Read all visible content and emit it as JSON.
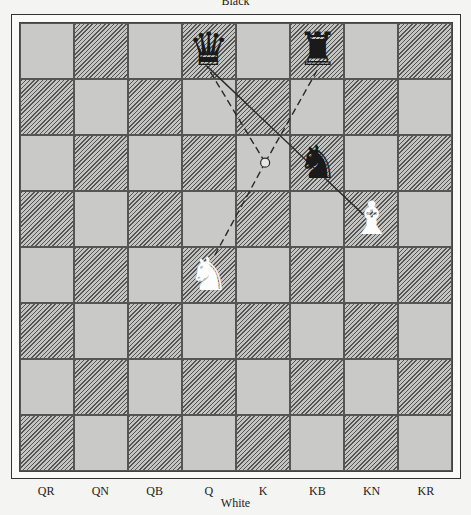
{
  "labels": {
    "top": "Black",
    "bottom": "White"
  },
  "files": [
    "QR",
    "QN",
    "QB",
    "Q",
    "K",
    "KB",
    "KN",
    "KR"
  ],
  "board": {
    "rows": 8,
    "cols": 8,
    "top_left_square": "light",
    "light_color": "#c9c9c7",
    "dark_style": "hatched"
  },
  "pieces": [
    {
      "id": "black-queen",
      "side": "black",
      "type": "queen",
      "glyph": "♛",
      "file": "Q",
      "col": 3,
      "row": 0
    },
    {
      "id": "black-rook",
      "side": "black",
      "type": "rook",
      "glyph": "♜",
      "file": "KB",
      "col": 5,
      "row": 0
    },
    {
      "id": "black-knight",
      "side": "black",
      "type": "knight",
      "glyph": "♞",
      "file": "KB",
      "col": 5,
      "row": 2
    },
    {
      "id": "white-bishop",
      "side": "white",
      "type": "bishop",
      "glyph": "♝",
      "file": "KN",
      "col": 6,
      "row": 3
    },
    {
      "id": "white-knight",
      "side": "white",
      "type": "knight",
      "glyph": "♞",
      "file": "Q",
      "col": 3,
      "row": 4
    }
  ],
  "annotations": {
    "target_circle": {
      "file": "K",
      "col": 4,
      "row": 2
    },
    "lines": [
      {
        "name": "bishop-to-queen",
        "style": "solid",
        "from": "white-bishop",
        "to": "black-queen"
      },
      {
        "name": "target-to-queen",
        "style": "dashed",
        "from": "target_circle",
        "to": "black-queen"
      },
      {
        "name": "target-to-rook",
        "style": "dashed",
        "from": "target_circle",
        "to": "black-rook"
      },
      {
        "name": "knight-to-target",
        "style": "dashed",
        "from": "white-knight",
        "to": "target_circle"
      }
    ]
  }
}
